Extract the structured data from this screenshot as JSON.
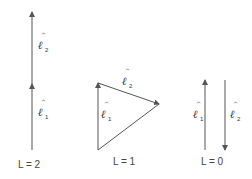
{
  "colors": {
    "line": "#555555",
    "text": "#333333",
    "background": "#ffffff"
  },
  "vector_symbol": "ℓ",
  "hat_symbol": "^",
  "panels": [
    {
      "caption": "L = 2",
      "vectors": [
        {
          "name": "l1",
          "symbol": "ℓ",
          "subscript": "1"
        },
        {
          "name": "l2",
          "symbol": "ℓ",
          "subscript": "2"
        }
      ]
    },
    {
      "caption": "L = 1",
      "vectors": [
        {
          "name": "l1",
          "symbol": "ℓ",
          "subscript": "1"
        },
        {
          "name": "l2",
          "symbol": "ℓ",
          "subscript": "2"
        }
      ]
    },
    {
      "caption": "L = 0",
      "vectors": [
        {
          "name": "l1",
          "symbol": "ℓ",
          "subscript": "1"
        },
        {
          "name": "l2",
          "symbol": "ℓ",
          "subscript": "2"
        }
      ]
    }
  ]
}
